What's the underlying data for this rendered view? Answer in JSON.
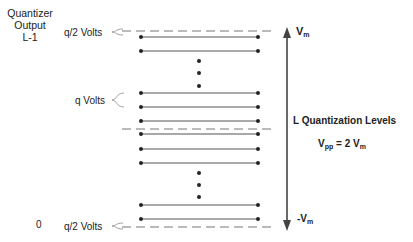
{
  "labels": {
    "quantizer_output_line1": "Quantizer",
    "quantizer_output_line2": "Output",
    "top_level_index": "L-1",
    "bottom_level_index": "0",
    "top_half_step": "q/2 Volts",
    "step": "q Volts",
    "bottom_half_step": "q/2 Volts",
    "vmax_main": "V",
    "vmax_sub": "m",
    "vmin_prefix": "-V",
    "vmin_sub": "m",
    "levels_title": "L Quantization Levels",
    "vpp_main": "V",
    "vpp_sub": "pp",
    "vpp_eq": " = 2 V",
    "vpp_eq_sub": "m"
  },
  "geometry": {
    "line_x1": 141,
    "line_x2": 258,
    "dash_x1": 122,
    "dash_x2": 275,
    "levels_y": [
      37,
      51,
      93,
      107,
      121,
      134,
      149,
      163,
      205,
      219
    ],
    "dashed_y": [
      31,
      129,
      227
    ],
    "ellipsis_top_y": [
      61,
      73,
      86
    ],
    "ellipsis_bottom_y": [
      173,
      185,
      197
    ],
    "ellipsis_x": 199,
    "arrow_x": 287,
    "arrow_top_y": 28,
    "arrow_bottom_y": 230
  },
  "colors": {
    "line": "#555555",
    "dot": "#222222",
    "dashed": "#777777",
    "arrow": "#444444",
    "brace": "#888888"
  }
}
